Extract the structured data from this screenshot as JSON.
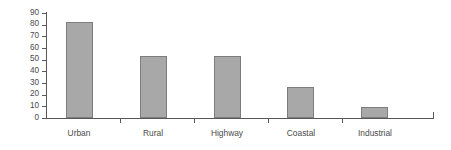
{
  "chart_data": {
    "type": "bar",
    "title": "",
    "subtitle": "",
    "xlabel": "",
    "ylabel": "Percent successful",
    "categories": [
      "Urban",
      "Rural",
      "Highway",
      "Coastal",
      "Industrial"
    ],
    "values": [
      82,
      53,
      53,
      27,
      9.5
    ],
    "series": [
      {
        "name": "Percent successful",
        "values": [
          82,
          53,
          53,
          27,
          9.5
        ]
      }
    ],
    "ylim": [
      0,
      90
    ],
    "ytick_labels": [
      "90",
      "80",
      "70",
      "60",
      "50",
      "40",
      "30",
      "20",
      "10",
      "0"
    ],
    "ytick_values": [
      90,
      80,
      70,
      60,
      50,
      40,
      30,
      20,
      10,
      0
    ],
    "ytick_step": 10,
    "grid": false,
    "legend": "none",
    "legend_position": "none",
    "annotations": [],
    "colors": {
      "bar_fill": "#a8a8a8",
      "bar_border": "#7d7d7d",
      "axis": "#58585a",
      "text": "#4a4a4a",
      "background": "#ffffff"
    }
  }
}
